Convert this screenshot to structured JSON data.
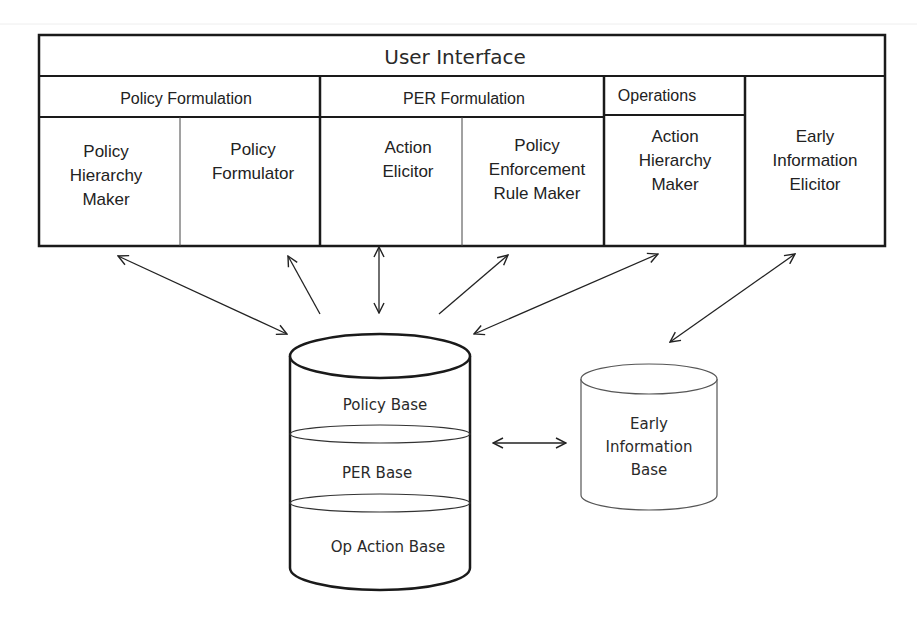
{
  "diagram": {
    "user_interface": {
      "title": "User Interface"
    },
    "groups": [
      {
        "label": "Policy Formulation",
        "components": [
          {
            "lines": [
              "Policy",
              "Hierarchy",
              "Maker"
            ]
          },
          {
            "lines": [
              "Policy",
              "Formulator"
            ]
          }
        ]
      },
      {
        "label": "PER Formulation",
        "components": [
          {
            "lines": [
              "Action",
              "Elicitor"
            ]
          },
          {
            "lines": [
              "Policy",
              "Enforcement",
              "Rule Maker"
            ]
          }
        ]
      },
      {
        "label": "Operations",
        "components": [
          {
            "lines": [
              "Action",
              "Hierarchy",
              "Maker"
            ]
          }
        ]
      }
    ],
    "standalone_component": {
      "lines": [
        "Early",
        "Information",
        "Elicitor"
      ]
    },
    "main_database": {
      "layers": [
        "Policy Base",
        "PER Base",
        "Op Action Base"
      ]
    },
    "early_database": {
      "lines": [
        "Early",
        "Information",
        "Base"
      ]
    },
    "colors": {
      "stroke": "#1a1a1a",
      "text": "#222222",
      "light_stroke": "#555555"
    }
  }
}
